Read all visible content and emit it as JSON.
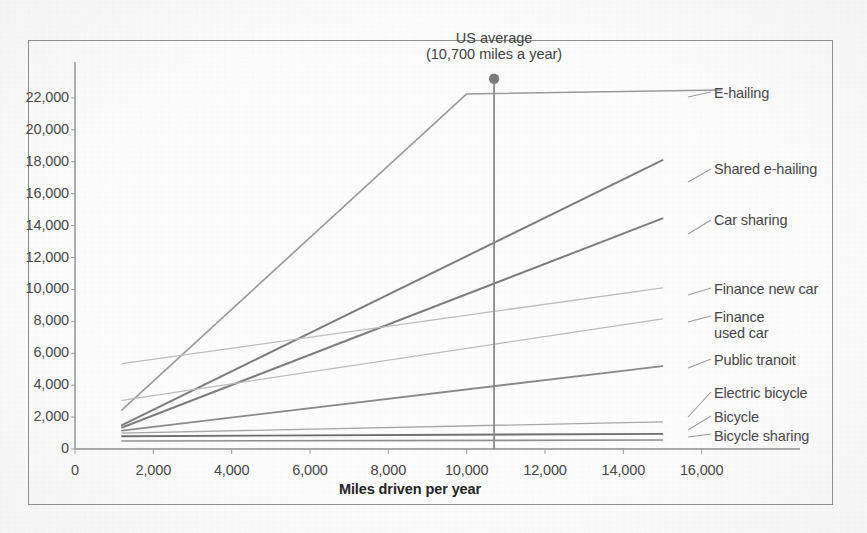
{
  "chart_data": {
    "type": "line",
    "title": "",
    "xlabel": "Miles driven per year",
    "ylabel": "",
    "xlim": [
      0,
      16800
    ],
    "ylim": [
      0,
      23500
    ],
    "grid": false,
    "legend_position": "right-inline-labels",
    "xticks": [
      "0",
      "2,000",
      "4,000",
      "6,000",
      "8,000",
      "10,000",
      "12,000",
      "14,000",
      "16,000"
    ],
    "xtick_values": [
      0,
      2000,
      4000,
      6000,
      8000,
      10000,
      12000,
      14000,
      16000
    ],
    "yticks": [
      "0",
      "2,000",
      "4,000",
      "6,000",
      "8,000",
      "10,000",
      "12,000",
      "14,000",
      "16,000",
      "18,000",
      "20,000",
      "22,000"
    ],
    "ytick_values": [
      0,
      2000,
      4000,
      6000,
      8000,
      10000,
      12000,
      14000,
      16000,
      18000,
      20000,
      22000
    ],
    "annotations": [
      {
        "name": "us-average",
        "line1": "US average",
        "line2": "(10,700 miles a year)",
        "x": 10700,
        "marker_y": 23200,
        "y_bottom": 0
      }
    ],
    "series": [
      {
        "name": "E-hailing",
        "label": "E-hailing",
        "color": "#9a9a9a",
        "width": 1.6,
        "points": [
          [
            1200,
            2450
          ],
          [
            10000,
            22250
          ],
          [
            16500,
            22500
          ]
        ]
      },
      {
        "name": "Shared e-hailing",
        "label": "Shared e-hailing",
        "color": "#7d7d7d",
        "width": 2.0,
        "points": [
          [
            1200,
            1500
          ],
          [
            15000,
            18100
          ]
        ]
      },
      {
        "name": "Car sharing",
        "label": "Car sharing",
        "color": "#7d7d7d",
        "width": 2.0,
        "points": [
          [
            1200,
            1350
          ],
          [
            15000,
            14450
          ]
        ]
      },
      {
        "name": "Finance new car",
        "label": "Finance new car",
        "color": "#bdbdbd",
        "width": 1.3,
        "points": [
          [
            1200,
            5350
          ],
          [
            15000,
            10100
          ]
        ]
      },
      {
        "name": "Finance used car",
        "label": "Finance\nused car",
        "color": "#bdbdbd",
        "width": 1.3,
        "points": [
          [
            1200,
            3050
          ],
          [
            15000,
            8150
          ]
        ]
      },
      {
        "name": "Public transit",
        "label": "Public tranoit",
        "color": "#8a8a8a",
        "width": 1.8,
        "points": [
          [
            1200,
            1150
          ],
          [
            15000,
            5200
          ]
        ]
      },
      {
        "name": "Electric bicycle",
        "label": "Electric bicycle",
        "color": "#a8a8a8",
        "width": 1.3,
        "points": [
          [
            1200,
            1000
          ],
          [
            15000,
            1700
          ]
        ]
      },
      {
        "name": "Bicycle",
        "label": "Bicycle",
        "color": "#6f6f6f",
        "width": 1.8,
        "points": [
          [
            1200,
            800
          ],
          [
            15000,
            950
          ]
        ]
      },
      {
        "name": "Bicycle sharing",
        "label": "Bicycle sharing",
        "color": "#8f8f8f",
        "width": 1.6,
        "points": [
          [
            1200,
            500
          ],
          [
            15000,
            560
          ]
        ]
      }
    ],
    "label_anchors": [
      {
        "name": "E-hailing",
        "x": 714,
        "y": 85,
        "leader_from_x": 688,
        "leader_from_y": 97,
        "leader_to_x": 711,
        "leader_to_y": 92
      },
      {
        "name": "Shared e-hailing",
        "x": 714,
        "y": 161,
        "leader_from_x": 688,
        "leader_from_y": 182,
        "leader_to_x": 711,
        "leader_to_y": 169
      },
      {
        "name": "Car sharing",
        "x": 714,
        "y": 212,
        "leader_from_x": 688,
        "leader_from_y": 234,
        "leader_to_x": 711,
        "leader_to_y": 220
      },
      {
        "name": "Finance new car",
        "x": 714,
        "y": 281,
        "leader_from_x": 688,
        "leader_from_y": 295,
        "leader_to_x": 711,
        "leader_to_y": 288
      },
      {
        "name": "Finance used car",
        "x": 714,
        "y": 309,
        "leader_from_x": 688,
        "leader_from_y": 322,
        "leader_to_x": 711,
        "leader_to_y": 316
      },
      {
        "name": "Public transit",
        "x": 714,
        "y": 352,
        "leader_from_x": 688,
        "leader_from_y": 368,
        "leader_to_x": 711,
        "leader_to_y": 359
      },
      {
        "name": "Electric bicycle",
        "x": 714,
        "y": 385,
        "leader_from_x": 688,
        "leader_from_y": 417,
        "leader_to_x": 711,
        "leader_to_y": 392
      },
      {
        "name": "Bicycle",
        "x": 714,
        "y": 409,
        "leader_from_x": 688,
        "leader_from_y": 430,
        "leader_to_x": 711,
        "leader_to_y": 416
      },
      {
        "name": "Bicycle sharing",
        "x": 714,
        "y": 428,
        "leader_from_x": 688,
        "leader_from_y": 437,
        "leader_to_x": 711,
        "leader_to_y": 434
      }
    ]
  },
  "axes": {
    "x_title": "Miles driven per year"
  }
}
